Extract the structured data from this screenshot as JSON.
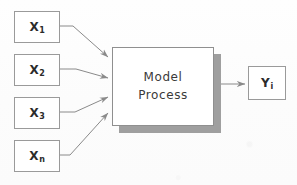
{
  "diagram": {
    "background_color": "#fdfdfd",
    "line_color": "#8f8f8f",
    "shadow_color": "#9f9f9f",
    "text_color": "#2b2b2b",
    "inputs": [
      {
        "id": "x1",
        "base": "X",
        "sub": "1",
        "x": 14,
        "y": 11,
        "w": 46,
        "h": 32
      },
      {
        "id": "x2",
        "base": "X",
        "sub": "2",
        "x": 14,
        "y": 54,
        "w": 46,
        "h": 32
      },
      {
        "id": "x3",
        "base": "X",
        "sub": "3",
        "x": 14,
        "y": 97,
        "w": 46,
        "h": 32
      },
      {
        "id": "xn",
        "base": "X",
        "sub": "n",
        "x": 14,
        "y": 140,
        "w": 46,
        "h": 32
      }
    ],
    "process": {
      "id": "model-process",
      "line1": "Model",
      "line2": "Process",
      "x": 112,
      "y": 47,
      "w": 102,
      "h": 79,
      "shadow_offset_x": 7,
      "shadow_offset_y": 7
    },
    "output": {
      "id": "yi",
      "base": "Y",
      "sub": "i",
      "x": 248,
      "y": 66,
      "w": 38,
      "h": 34
    },
    "connectors": [
      {
        "id": "x1-to-process",
        "from": "x1",
        "to": "model-process",
        "arrow": true
      },
      {
        "id": "x2-to-process",
        "from": "x2",
        "to": "model-process",
        "arrow": true
      },
      {
        "id": "x3-to-process",
        "from": "x3",
        "to": "model-process",
        "arrow": true
      },
      {
        "id": "xn-to-process",
        "from": "xn",
        "to": "model-process",
        "arrow": true
      },
      {
        "id": "process-to-output",
        "from": "model-process",
        "to": "yi",
        "arrow": true
      }
    ]
  }
}
